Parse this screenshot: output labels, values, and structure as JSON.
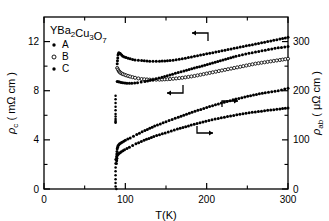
{
  "figure": {
    "background": "#ffffff",
    "ink": "#000000"
  },
  "annotations": {
    "sample_label": "YBa",
    "sample_label_full": "YBa2Cu3O7",
    "legend_title_parts": [
      "Y",
      "Ba",
      "2",
      "Cu",
      "3",
      "O",
      "7"
    ],
    "arrow_left_upper": "←",
    "arrow_left_middle": "←",
    "arrow_right_upper": "→",
    "arrow_right_lower": "→"
  },
  "legend": {
    "items": [
      {
        "label": "A",
        "marker": "filled-dot"
      },
      {
        "label": "B",
        "marker": "open-circle"
      },
      {
        "label": "C",
        "marker": "filled-dot"
      }
    ]
  },
  "chart_data": {
    "type": "scatter",
    "title": "",
    "subtitle": "",
    "xlabel": "T(K)",
    "ylabel": "ρc (mΩ cm)",
    "ylabel_right": "ρab (μΩ cm)",
    "xlim": [
      0,
      300
    ],
    "ylim": [
      0,
      14
    ],
    "ylim_right": [
      0,
      350
    ],
    "xticks": [
      0,
      100,
      200,
      300
    ],
    "xticklabels": [
      "0",
      "100",
      "200",
      "300"
    ],
    "xminorticks": [
      50,
      150,
      250
    ],
    "yticks": [
      0,
      4,
      8,
      12
    ],
    "yticklabels": [
      "0",
      "4",
      "8",
      "12"
    ],
    "yminorticks": [
      2,
      6,
      10
    ],
    "yticks_right": [
      0,
      100,
      200,
      300
    ],
    "yticklabels_right": [
      "0",
      "100",
      "200",
      "300"
    ],
    "yminorticks_right": [
      50,
      150,
      250
    ],
    "grid": false,
    "legend_position": "upper-left",
    "units": {
      "x": "K",
      "y_left": "mΩ cm",
      "y_right": "μΩ cm"
    },
    "series": [
      {
        "name": "A rho_c",
        "axis": "left",
        "marker": "filled-dot",
        "arrow": "left",
        "x": [
          90,
          91,
          92,
          94,
          97,
          101,
          106,
          112,
          120,
          130,
          142,
          155,
          170,
          185,
          200,
          215,
          230,
          245,
          260,
          275,
          290,
          300
        ],
        "y": [
          10.2,
          10.9,
          11.1,
          11.0,
          10.8,
          10.7,
          10.6,
          10.5,
          10.45,
          10.4,
          10.4,
          10.45,
          10.6,
          10.8,
          11.0,
          11.2,
          11.4,
          11.6,
          11.8,
          12.0,
          12.2,
          12.35
        ]
      },
      {
        "name": "B rho_c",
        "axis": "left",
        "marker": "open-circle",
        "arrow": "left",
        "x": [
          90,
          92,
          94,
          97,
          101,
          106,
          112,
          120,
          130,
          142,
          155,
          170,
          185,
          200,
          215,
          230,
          245,
          260,
          275,
          290,
          300
        ],
        "y": [
          9.85,
          9.6,
          9.45,
          9.35,
          9.25,
          9.15,
          9.05,
          8.95,
          8.9,
          8.9,
          8.95,
          9.05,
          9.2,
          9.4,
          9.6,
          9.8,
          10.0,
          10.2,
          10.35,
          10.5,
          10.6
        ]
      },
      {
        "name": "C rho_c",
        "axis": "left",
        "marker": "filled-dot",
        "arrow": "left",
        "x": [
          90,
          93,
          97,
          102,
          108,
          115,
          124,
          134,
          145,
          158,
          172,
          188,
          204,
          220,
          236,
          252,
          268,
          284,
          300
        ],
        "y": [
          8.75,
          8.7,
          8.65,
          8.6,
          8.6,
          8.65,
          8.75,
          8.9,
          9.1,
          9.35,
          9.6,
          9.9,
          10.2,
          10.5,
          10.8,
          11.05,
          11.25,
          11.45,
          11.6
        ]
      },
      {
        "name": "A rho_ab",
        "axis": "right",
        "marker": "filled-dot",
        "arrow": "right",
        "x": [
          89,
          90,
          91,
          93,
          96,
          100,
          106,
          114,
          124,
          136,
          150,
          165,
          182,
          200,
          218,
          236,
          254,
          272,
          288,
          300
        ],
        "y": [
          60,
          82,
          88,
          92,
          95,
          99,
          104,
          111,
          119,
          128,
          137,
          146,
          156,
          166,
          175,
          183,
          190,
          196,
          200,
          205
        ]
      },
      {
        "name": "C rho_ab",
        "axis": "right",
        "marker": "filled-dot",
        "arrow": "right",
        "x": [
          89,
          90,
          92,
          95,
          99,
          105,
          113,
          123,
          135,
          149,
          164,
          181,
          199,
          218,
          237,
          256,
          275,
          290,
          300
        ],
        "y": [
          52,
          68,
          72,
          76,
          80,
          85,
          92,
          99,
          107,
          114,
          122,
          130,
          138,
          145,
          151,
          156,
          160,
          163,
          165
        ]
      },
      {
        "name": "transition scatter",
        "axis": "left",
        "marker": "mixed-dots",
        "arrow": "none",
        "x": [
          88,
          88,
          88,
          88,
          88,
          88,
          88,
          88,
          88,
          88,
          88
        ],
        "y": [
          7.6,
          7.3,
          7.0,
          6.7,
          6.4,
          6.1,
          5.9,
          5.7,
          5.55,
          5.45,
          5.4
        ]
      },
      {
        "name": "transition drop",
        "axis": "right",
        "marker": "filled-dot",
        "arrow": "none",
        "x": [
          88,
          88,
          88,
          88,
          88,
          88,
          88,
          88,
          89
        ],
        "y": [
          60,
          52,
          44,
          36,
          28,
          20,
          12,
          5,
          0
        ]
      }
    ]
  }
}
